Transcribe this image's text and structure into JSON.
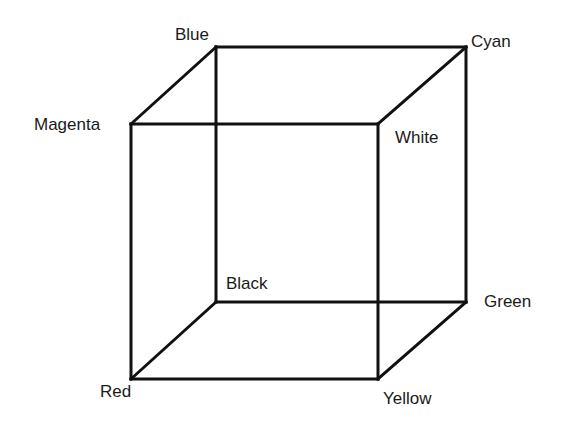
{
  "vertices": {
    "blue": {
      "label": "Blue",
      "x": 216,
      "y": 47
    },
    "cyan": {
      "label": "Cyan",
      "x": 466,
      "y": 47
    },
    "magenta": {
      "label": "Magenta",
      "x": 131,
      "y": 124
    },
    "white": {
      "label": "White",
      "x": 378,
      "y": 124
    },
    "black": {
      "label": "Black",
      "x": 216,
      "y": 302
    },
    "green": {
      "label": "Green",
      "x": 466,
      "y": 302
    },
    "red": {
      "label": "Red",
      "x": 131,
      "y": 379
    },
    "yellow": {
      "label": "Yellow",
      "x": 378,
      "y": 379
    }
  },
  "edge_color": "#111111"
}
